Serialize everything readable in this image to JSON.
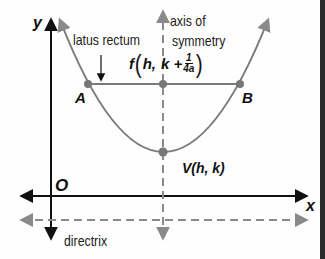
{
  "diagram": {
    "type": "parabola-anatomy",
    "labels": {
      "y_axis": "y",
      "x_axis": "x",
      "origin": "O",
      "latus_rectum": "latus rectum",
      "axis_of_symmetry_line1": "axis of",
      "axis_of_symmetry_line2": "symmetry",
      "focus_prefix": "f",
      "focus_coords_h": "h,",
      "focus_coords_k": "k +",
      "focus_frac_num": "1",
      "focus_frac_den": "4a",
      "point_a": "A",
      "point_b": "B",
      "vertex": "V(h, k)",
      "directrix": "directrix"
    },
    "colors": {
      "axes": "#111111",
      "curve": "#7a7a7a",
      "dashed": "#8a8a8a",
      "points": "#777777",
      "border": "#2b2b2b"
    }
  }
}
